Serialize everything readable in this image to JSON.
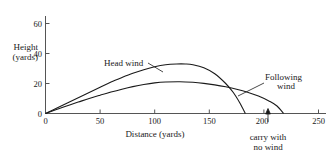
{
  "chart_data": {
    "type": "line",
    "title": "",
    "subtitle": "",
    "xlabel": "Distance (yards)",
    "ylabel_line1": "Height",
    "ylabel_line2": "(yards)",
    "xlim": [
      0,
      250
    ],
    "ylim": [
      0,
      65
    ],
    "xticks": [
      0,
      50,
      100,
      150,
      200,
      250
    ],
    "yticks": [
      0,
      20,
      40,
      60
    ],
    "xtick_labels": [
      "0",
      "50",
      "100",
      "150",
      "200",
      "250"
    ],
    "ytick_labels": [
      "0",
      "20",
      "40",
      "60"
    ],
    "grid": false,
    "legend": "inline-annotations",
    "series": [
      {
        "name": "Head wind",
        "label": "Head wind",
        "peak_x": 128,
        "peak_y": 33,
        "landing_x": 183,
        "x": [
          0,
          10,
          20,
          30,
          40,
          50,
          60,
          70,
          80,
          90,
          100,
          110,
          120,
          128,
          135,
          145,
          155,
          165,
          172,
          178,
          183
        ],
        "y": [
          0,
          3.5,
          7,
          10.5,
          14,
          17.5,
          21,
          24,
          26.8,
          29.2,
          31.2,
          32.5,
          33,
          33,
          32.5,
          30.5,
          26.5,
          20,
          14,
          7,
          0
        ]
      },
      {
        "name": "Following wind",
        "label_line1": "Following",
        "label_line2": "wind",
        "peak_x": 123,
        "peak_y": 21,
        "landing_x": 218,
        "x": [
          0,
          10,
          20,
          30,
          40,
          50,
          60,
          70,
          80,
          90,
          100,
          110,
          123,
          135,
          145,
          155,
          165,
          175,
          185,
          195,
          205,
          212,
          218
        ],
        "y": [
          0,
          2.6,
          5.2,
          7.6,
          10,
          12.2,
          14.3,
          16.2,
          17.9,
          19.3,
          20.4,
          21,
          21.2,
          20.8,
          20.1,
          19.1,
          17.8,
          16.2,
          14.2,
          11.6,
          8.2,
          5.0,
          0
        ]
      }
    ],
    "annotations": [
      {
        "name": "carry-with-no-wind",
        "text_line1": "carry with",
        "text_line2": "no wind",
        "x_value": 205,
        "marker": "up-arrow"
      }
    ]
  }
}
